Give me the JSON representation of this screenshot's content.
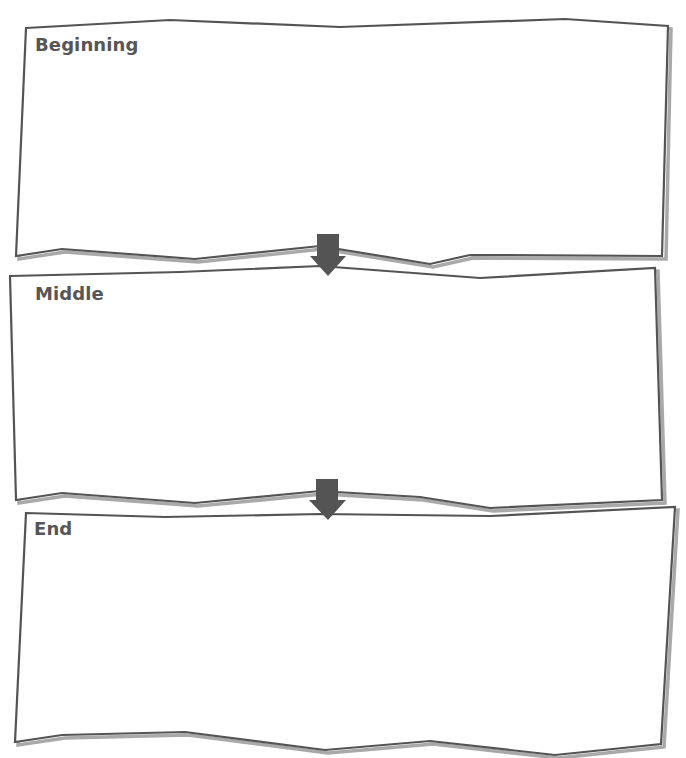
{
  "worksheet": {
    "frames": [
      {
        "label": "Beginning",
        "answer": ""
      },
      {
        "label": "Middle",
        "answer": ""
      },
      {
        "label": "End",
        "answer": ""
      }
    ],
    "connectors": [
      {
        "icon": "down-arrow-icon",
        "from": "Beginning",
        "to": "Middle"
      },
      {
        "icon": "down-arrow-icon",
        "from": "Middle",
        "to": "End"
      }
    ],
    "colors": {
      "frame_stroke": "#545454",
      "frame_shadow": "#a9a9a9",
      "arrow_fill": "#545454",
      "label_text": "#565656",
      "background": "#ffffff"
    }
  }
}
